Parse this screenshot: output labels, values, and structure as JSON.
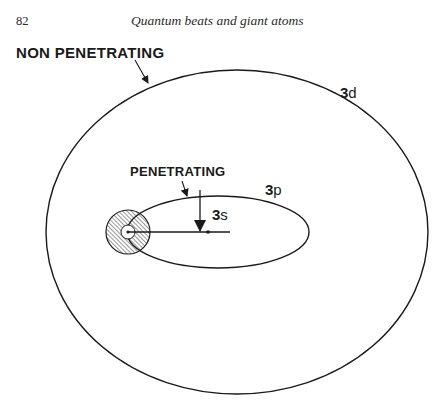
{
  "page": {
    "number": "82",
    "running_head": "Quantum beats and giant atoms"
  },
  "figure": {
    "labels": {
      "non_penetrating": "NON PENETRATING",
      "penetrating": "PENETRATING",
      "orbit_3d_n": "3",
      "orbit_3d_l": "d",
      "orbit_3p_n": "3",
      "orbit_3p_l": "p",
      "orbit_3s_n": "3",
      "orbit_3s_l": "s"
    },
    "colors": {
      "ink": "#1a1a1a",
      "paper": "#ffffff"
    },
    "geometry": {
      "outer_ellipse_3d": {
        "cx": 237,
        "cy": 232,
        "rx": 191,
        "ry": 162
      },
      "inner_ellipse_3p": {
        "cx": 218,
        "cy": 232,
        "rx": 91,
        "ry": 36
      },
      "core": {
        "cx": 128,
        "cy": 232,
        "r": 22
      },
      "nucleus": {
        "cx": 128,
        "cy": 232,
        "r": 6
      },
      "orbit_3s_line": {
        "x1": 128,
        "y1": 232,
        "x2": 230,
        "y2": 232
      }
    }
  }
}
